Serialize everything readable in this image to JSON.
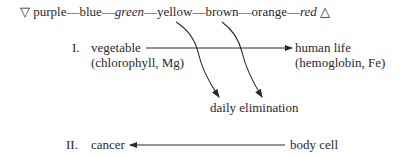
{
  "spectrum": {
    "start_symbol": "▽",
    "colors": [
      {
        "label": "purple",
        "italic": false
      },
      {
        "label": "blue",
        "italic": false
      },
      {
        "label": "green",
        "italic": true
      },
      {
        "label": "yellow",
        "italic": false
      },
      {
        "label": "brown",
        "italic": false
      },
      {
        "label": "orange",
        "italic": false
      },
      {
        "label": "red",
        "italic": true
      }
    ],
    "separator": "—",
    "end_symbol": "△"
  },
  "section1": {
    "numeral": "I.",
    "source": "vegetable",
    "source_note": "(chlorophyll, Mg)",
    "target": "human life",
    "target_note": "(hemoglobin, Fe)",
    "branch_target": "daily elimination"
  },
  "section2": {
    "numeral": "II.",
    "target": "cancer",
    "source": "body cell"
  },
  "colors": {
    "ink": "#2a2a2a",
    "background": "#ffffff"
  }
}
